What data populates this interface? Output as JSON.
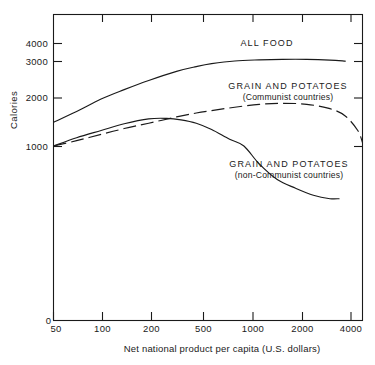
{
  "chart_data": {
    "type": "line",
    "title": "",
    "xlabel": "Net national product per capita (U.S. dollars)",
    "ylabel": "Calories",
    "xscale": "log",
    "xlim": [
      50,
      4500
    ],
    "ylim": [
      0,
      4400
    ],
    "grid": false,
    "legend_position": "inline-annotations",
    "xticks": [
      {
        "value": 50,
        "label": "50"
      },
      {
        "value": 100,
        "label": "100"
      },
      {
        "value": 200,
        "label": "200"
      },
      {
        "value": 500,
        "label": "500"
      },
      {
        "value": 1000,
        "label": "1000"
      },
      {
        "value": 2000,
        "label": "2000"
      },
      {
        "value": 4000,
        "label": "4000"
      }
    ],
    "yticks": [
      {
        "value": 0,
        "label": "0"
      },
      {
        "value": 1000,
        "label": "1000"
      },
      {
        "value": 2000,
        "label": "2000"
      },
      {
        "value": 3000,
        "label": "3000"
      },
      {
        "value": 4000,
        "label": "4000"
      }
    ],
    "series": [
      {
        "name": "ALL FOOD",
        "label": "ALL FOOD",
        "sublabel": "",
        "style": "solid",
        "x": [
          50,
          70,
          100,
          140,
          200,
          300,
          400,
          500,
          700,
          1000,
          1400,
          2000,
          2800,
          3500
        ],
        "values": [
          1500,
          1720,
          1980,
          2230,
          2480,
          2730,
          2860,
          2940,
          3030,
          3090,
          3120,
          3120,
          3080,
          3020
        ]
      },
      {
        "name": "GRAIN AND POTATOES (Communist countries)",
        "label": "GRAIN AND POTATOES",
        "sublabel": "(Communist countries)",
        "style": "dashed",
        "x": [
          50,
          70,
          100,
          140,
          200,
          300,
          400,
          500,
          700,
          1000,
          1400,
          2000,
          2800,
          3500,
          4200,
          4500
        ],
        "values": [
          1010,
          1120,
          1250,
          1370,
          1480,
          1610,
          1690,
          1740,
          1810,
          1870,
          1890,
          1870,
          1780,
          1630,
          1330,
          1080
        ]
      },
      {
        "name": "GRAIN AND POTATOES (non-Communist countries)",
        "label": "GRAIN AND POTATOES",
        "sublabel": "(non-Communist countries)",
        "style": "solid",
        "x": [
          50,
          70,
          100,
          140,
          200,
          260,
          320,
          400,
          500,
          650,
          800,
          1000,
          1300,
          1700,
          2200,
          2800,
          3200
        ],
        "values": [
          1010,
          1180,
          1330,
          1470,
          1570,
          1580,
          1550,
          1480,
          1350,
          1150,
          1010,
          900,
          810,
          760,
          720,
          700,
          700
        ]
      }
    ],
    "annotations": [
      {
        "text": "ALL FOOD",
        "x": 1000,
        "y": 3350
      },
      {
        "text": "GRAIN AND POTATOES",
        "x": 1300,
        "y": 2200
      },
      {
        "text": "(Communist countries)",
        "x": 1300,
        "y": 2010
      },
      {
        "text": "GRAIN AND POTATOES",
        "x": 1250,
        "y": 1070
      },
      {
        "text": "(non-Communist countries)",
        "x": 1250,
        "y": 930
      }
    ],
    "colors": {
      "ink": "#1a1a1a",
      "background": "#ffffff"
    }
  }
}
